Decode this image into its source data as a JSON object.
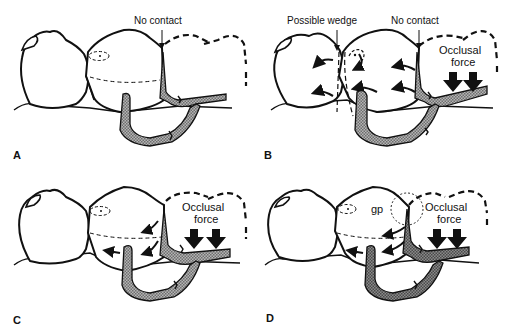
{
  "figure": {
    "panels": [
      {
        "id": "A",
        "label": "A",
        "annotations": {
          "no_contact": "No contact"
        }
      },
      {
        "id": "B",
        "label": "B",
        "annotations": {
          "possible_wedge": "Possible wedge",
          "no_contact": "No contact",
          "occlusal_force_line1": "Occlusal",
          "occlusal_force_line2": "force"
        }
      },
      {
        "id": "C",
        "label": "C",
        "annotations": {
          "occlusal_force_line1": "Occlusal",
          "occlusal_force_line2": "force"
        }
      },
      {
        "id": "D",
        "label": "D",
        "annotations": {
          "gp": "gp",
          "occlusal_force_line1": "Occlusal",
          "occlusal_force_line2": "force"
        }
      }
    ],
    "colors": {
      "line": "#111111",
      "clasp_fill": "#9a9a9a",
      "clasp_fill_dark": "#777777",
      "background": "#ffffff"
    }
  }
}
